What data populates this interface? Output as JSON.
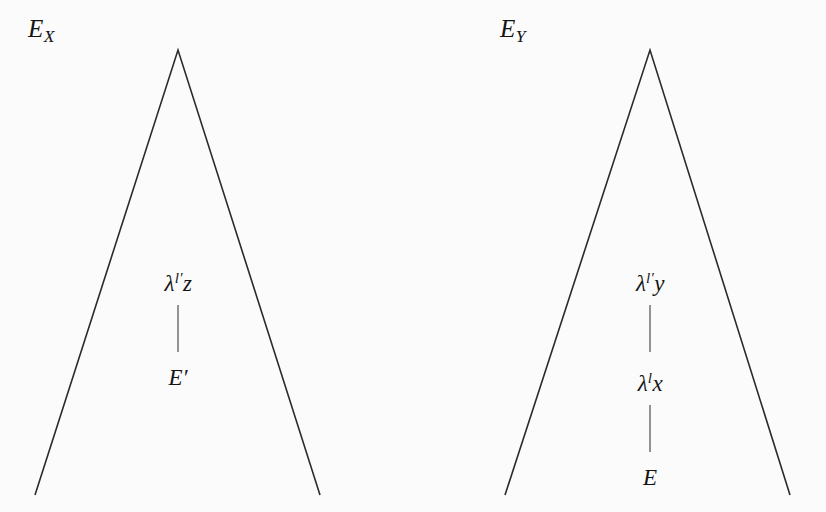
{
  "figure": {
    "background_color": "#fbfbfb",
    "ink_color": "#1a1a1a",
    "width": 826,
    "height": 512
  },
  "trees": {
    "left": {
      "name": "E_X",
      "label_prefix": "E",
      "label_subscript": "X",
      "apex": {
        "x": 178,
        "y": 50
      },
      "base_left": {
        "x": 35,
        "y": 495
      },
      "base_right": {
        "x": 320,
        "y": 495
      },
      "label_position": {
        "x": 28,
        "y": 16
      },
      "nodes": [
        {
          "id": "left-node-top",
          "text": "λⁱ′z",
          "lambda": "λ",
          "superscript": "l′",
          "variable": "z",
          "x": 178,
          "y": 272
        },
        {
          "id": "left-node-bottom",
          "text": "E′",
          "lambda": "",
          "superscript": "",
          "variable": "E′",
          "x": 178,
          "y": 366
        }
      ],
      "connectors": [
        {
          "x": 178,
          "y_top": 305,
          "y_bottom": 352
        }
      ]
    },
    "right": {
      "name": "E_Y",
      "label_prefix": "E",
      "label_subscript": "Y",
      "apex": {
        "x": 650,
        "y": 50
      },
      "base_left": {
        "x": 505,
        "y": 495
      },
      "base_right": {
        "x": 790,
        "y": 495
      },
      "label_position": {
        "x": 500,
        "y": 16
      },
      "nodes": [
        {
          "id": "right-node-top",
          "text": "λⁱ′y",
          "lambda": "λ",
          "superscript": "l′",
          "variable": "y",
          "x": 650,
          "y": 272
        },
        {
          "id": "right-node-middle",
          "text": "λⁱx",
          "lambda": "λ",
          "superscript": "l",
          "variable": "x",
          "x": 650,
          "y": 372
        },
        {
          "id": "right-node-bottom",
          "text": "E",
          "lambda": "",
          "superscript": "",
          "variable": "E",
          "x": 650,
          "y": 466
        }
      ],
      "connectors": [
        {
          "x": 650,
          "y_top": 305,
          "y_bottom": 352
        },
        {
          "x": 650,
          "y_top": 405,
          "y_bottom": 452
        }
      ]
    }
  },
  "labels": {
    "left_tree_label": "E",
    "left_tree_subscript": "X",
    "right_tree_label": "E",
    "right_tree_subscript": "Y",
    "lambda_glyph": "λ",
    "prime_glyph": "′",
    "left_top_superscript_letter": "l",
    "left_top_variable": "z",
    "left_bottom_text": "E",
    "left_bottom_prime": "′",
    "right_top_superscript_letter": "l",
    "right_top_variable": "y",
    "right_middle_superscript_letter": "l",
    "right_middle_variable": "x",
    "right_bottom_text": "E"
  }
}
